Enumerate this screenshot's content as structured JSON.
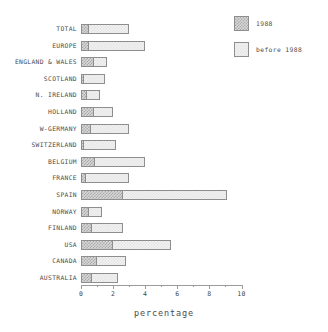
{
  "chart_data": {
    "type": "bar",
    "orientation": "horizontal",
    "stacked": true,
    "title": "",
    "xlabel": "percentage",
    "ylabel": "",
    "xlim": [
      0,
      10.5
    ],
    "xticks": [
      0,
      2,
      4,
      6,
      8,
      10
    ],
    "xtick_labels": [
      "0",
      "2",
      "4",
      "6",
      "8",
      "10"
    ],
    "minor_ticks": [
      1,
      3,
      5,
      7,
      9
    ],
    "grid": false,
    "legend_position": "top-right",
    "categories": [
      "TOTAL",
      "EUROPE",
      "ENGLAND & WALES",
      "SCOTLAND",
      "N. IRELAND",
      "HOLLAND",
      "W-GERMANY",
      "SWITZERLAND",
      "BELGIUM",
      "FRANCE",
      "SPAIN",
      "NORWAY",
      "FINLAND",
      "USA",
      "CANADA",
      "AUSTRALIA"
    ],
    "series": [
      {
        "name": "1988",
        "color": "#a8a8a8",
        "values": [
          0.5,
          0.5,
          0.8,
          0.2,
          0.4,
          0.8,
          0.6,
          0.2,
          0.9,
          0.3,
          2.6,
          0.5,
          0.7,
          2.0,
          1.0,
          0.7
        ]
      },
      {
        "name": "before 1988",
        "color": "#f2f2f2",
        "values": [
          2.5,
          3.5,
          0.8,
          1.3,
          0.8,
          1.2,
          2.4,
          2.0,
          3.1,
          2.7,
          6.5,
          0.8,
          1.9,
          3.6,
          1.8,
          1.6
        ]
      }
    ],
    "totals": [
      3.0,
      4.0,
      1.6,
      1.5,
      1.2,
      2.0,
      3.0,
      2.2,
      4.0,
      3.0,
      9.1,
      1.3,
      2.6,
      5.6,
      2.8,
      2.3
    ]
  },
  "legend": {
    "items": [
      {
        "label": "1988",
        "swatch": "recent"
      },
      {
        "label": "before 1988",
        "swatch": "before"
      }
    ]
  },
  "axis": {
    "title": "percentage"
  }
}
